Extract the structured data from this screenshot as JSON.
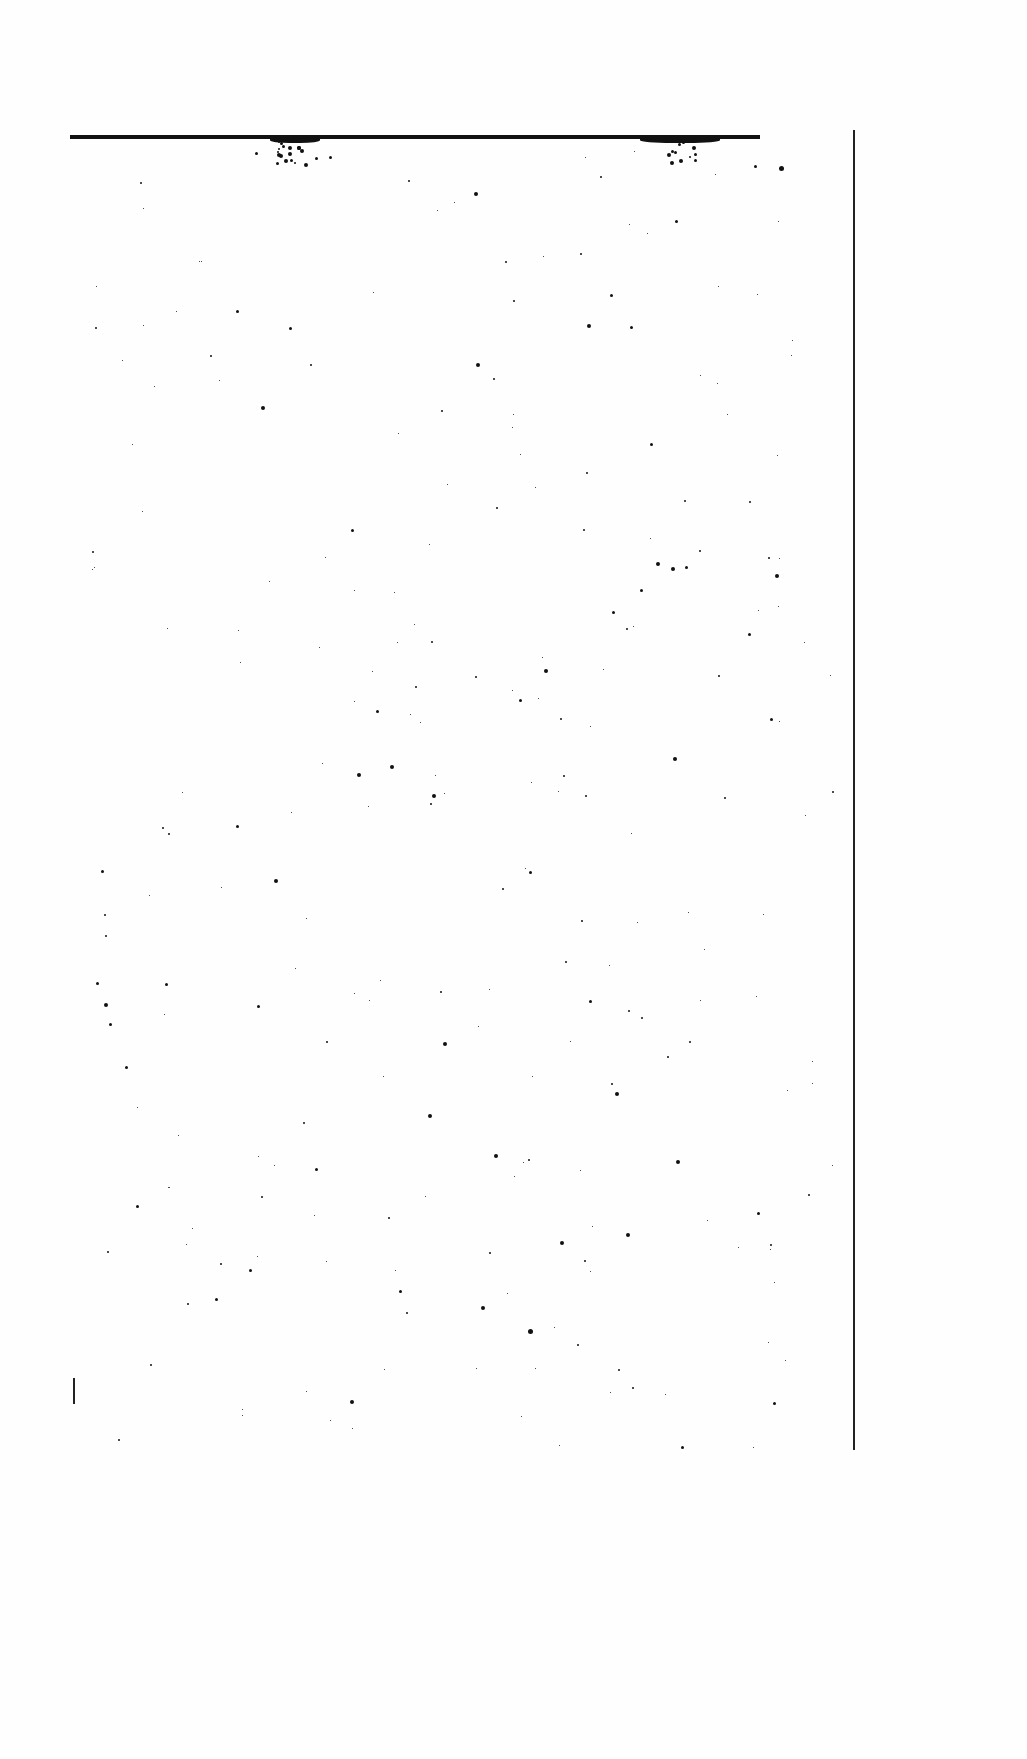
{
  "document": {
    "type": "blank scanned page",
    "text_content": "",
    "colors": {
      "paper": "#fefefe",
      "ink": "#111111"
    }
  },
  "rules": {
    "top": {
      "x": 70,
      "y": 135,
      "width": 690
    },
    "right": {
      "x": 853,
      "y": 130,
      "height": 1320
    }
  }
}
